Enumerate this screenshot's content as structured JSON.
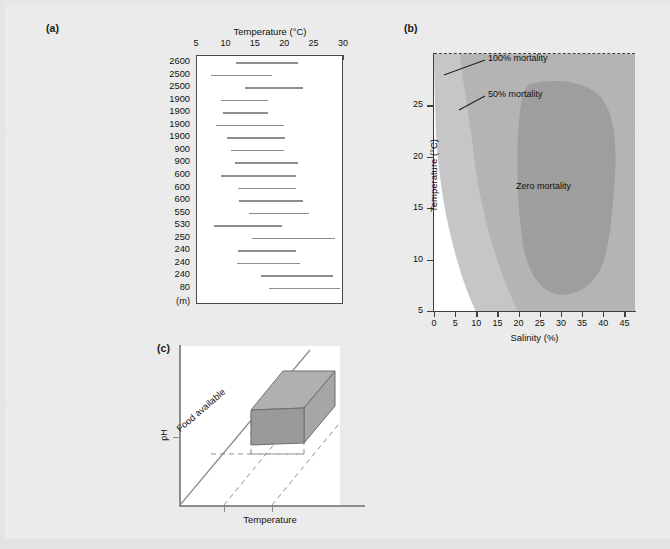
{
  "figure": {
    "background_color": "#ebebeb",
    "bar_color": "#8d8d8d",
    "axis_color": "#3f3f3f"
  },
  "panel_a": {
    "label": "(a)",
    "axis_title": "Temperature (°C)",
    "unit_label": "(m)",
    "ticks": [
      5,
      10,
      15,
      20,
      25,
      30
    ],
    "tick_labels": [
      "5",
      "10",
      "15",
      "20",
      "25",
      "30"
    ],
    "xlim": [
      5,
      30
    ],
    "altitude_unit": "m",
    "rows": [
      {
        "species": "Ranunculus glacialis",
        "altitude": "2600",
        "low": 11.6,
        "high": 22.2
      },
      {
        "species": "Oxyria digyna",
        "altitude": "2500",
        "low": 7.3,
        "high": 17.8
      },
      {
        "species": "Geum reptans",
        "altitude": "2500",
        "low": 13.2,
        "high": 23.1
      },
      {
        "species": "Pinus cembra",
        "altitude": "1900",
        "low": 9.0,
        "high": 17.1
      },
      {
        "species": "Picea abies",
        "altitude": "1900",
        "low": 9.4,
        "high": 17.1
      },
      {
        "species": "Betula pendula",
        "altitude": "1900",
        "low": 8.2,
        "high": 19.8
      },
      {
        "species": "Larix decidua",
        "altitude": "1900",
        "low": 10.1,
        "high": 19.9
      },
      {
        "species": "Picea abies",
        "altitude": "900",
        "low": 10.7,
        "high": 19.8
      },
      {
        "species": "Larix decidua",
        "altitude": "900",
        "low": 11.5,
        "high": 22.1
      },
      {
        "species": "Leucojum vernum",
        "altitude": "600",
        "low": 9.0,
        "high": 21.9
      },
      {
        "species": "Betula pendula",
        "altitude": "600",
        "low": 11.9,
        "high": 21.9
      },
      {
        "species": "Fagus sylvatica",
        "altitude": "600",
        "low": 12.1,
        "high": 23.0
      },
      {
        "species": "Taxus baccata",
        "altitude": "550",
        "low": 13.9,
        "high": 24.1
      },
      {
        "species": "Abies alba",
        "altitude": "530",
        "low": 7.9,
        "high": 19.4
      },
      {
        "species": "Prunus laurocerasus",
        "altitude": "250",
        "low": 14.3,
        "high": 28.4
      },
      {
        "species": "Quercus ilex",
        "altitude": "240",
        "low": 11.9,
        "high": 21.8
      },
      {
        "species": "Olea europaea",
        "altitude": "240",
        "low": 11.8,
        "high": 22.6
      },
      {
        "species": "Quercus pubescens",
        "altitude": "240",
        "low": 15.8,
        "high": 28.2
      },
      {
        "species": "Citrus limonum",
        "altitude": "80",
        "low": 17.2,
        "high": 29.4
      }
    ]
  },
  "panel_b": {
    "label": "(b)",
    "x_title": "Salinity (%)",
    "y_title": "Temperature (°C)",
    "x_ticks": [
      0,
      5,
      10,
      15,
      20,
      25,
      30,
      35,
      40,
      45
    ],
    "x_tick_labels": [
      "0",
      "5",
      "10",
      "15",
      "20",
      "25",
      "30",
      "35",
      "40",
      "45"
    ],
    "y_ticks": [
      5,
      10,
      15,
      20,
      25
    ],
    "y_tick_labels": [
      "5",
      "10",
      "15",
      "20",
      "25"
    ],
    "xlim": [
      0,
      47.5
    ],
    "ylim": [
      5,
      30
    ],
    "zones": [
      {
        "name": "100% mortality",
        "fill": "#c6c6c6"
      },
      {
        "name": "50% mortality",
        "fill": "#b4b4b4"
      },
      {
        "name": "Zero mortality",
        "fill": "#9e9e9e"
      }
    ],
    "annotations": [
      {
        "text": "100% mortality"
      },
      {
        "text": "50% mortality"
      },
      {
        "text": "Zero mortality"
      }
    ]
  },
  "panel_c": {
    "label": "(c)",
    "y_axis_label": "pH",
    "x_axis_label": "Temperature",
    "z_axis_label": "Food available",
    "box_front_color": "#9a9a9a",
    "box_top_color": "#b0b0b0",
    "box_side_color": "#a6a6a6"
  },
  "chart_data": [
    {
      "type": "bar",
      "panel": "(a)",
      "title": "Temperature (°C)",
      "xlabel": "Temperature (°C)",
      "ylabel": "Species (altitude, m)",
      "xlim": [
        5,
        30
      ],
      "grid": false,
      "orientation": "horizontal-range",
      "categories": [
        "Ranunculus glacialis 2600",
        "Oxyria digyna 2500",
        "Geum reptans 2500",
        "Pinus cembra 1900",
        "Picea abies 1900",
        "Betula pendula 1900",
        "Larix decidua 1900",
        "Picea abies 900",
        "Larix decidua 900",
        "Leucojum vernum 600",
        "Betula pendula 600",
        "Fagus sylvatica 600",
        "Taxus baccata 550",
        "Abies alba 530",
        "Prunus laurocerasus 250",
        "Quercus ilex 240",
        "Olea europaea 240",
        "Quercus pubescens 240",
        "Citrus limonum 80"
      ],
      "ranges": [
        [
          11.6,
          22.2
        ],
        [
          7.3,
          17.8
        ],
        [
          13.2,
          23.1
        ],
        [
          9.0,
          17.1
        ],
        [
          9.4,
          17.1
        ],
        [
          8.2,
          19.8
        ],
        [
          10.1,
          19.9
        ],
        [
          10.7,
          19.8
        ],
        [
          11.5,
          22.1
        ],
        [
          9.0,
          21.9
        ],
        [
          11.9,
          21.9
        ],
        [
          12.1,
          23.0
        ],
        [
          13.9,
          24.1
        ],
        [
          7.9,
          19.4
        ],
        [
          14.3,
          28.4
        ],
        [
          11.9,
          21.8
        ],
        [
          11.8,
          22.6
        ],
        [
          15.8,
          28.2
        ],
        [
          17.2,
          29.4
        ]
      ]
    },
    {
      "type": "heatmap",
      "panel": "(b)",
      "title": "Mortality contours",
      "xlabel": "Salinity (%)",
      "ylabel": "Temperature (°C)",
      "xlim": [
        0,
        47.5
      ],
      "ylim": [
        5,
        30
      ],
      "grid": false,
      "legend_position": "inline-annotations",
      "contours": [
        {
          "label": "100% mortality",
          "level": 100,
          "fill": "#c6c6c6"
        },
        {
          "label": "50% mortality",
          "level": 50,
          "fill": "#b4b4b4"
        },
        {
          "label": "Zero mortality",
          "level": 0,
          "fill": "#9e9e9e"
        }
      ]
    },
    {
      "type": "scatter",
      "panel": "(c)",
      "title": "Three-dimensional niche",
      "xlabel": "Temperature",
      "ylabel": "pH",
      "zlabel": "Food available",
      "grid": false,
      "annotations": [
        "Food available"
      ]
    }
  ]
}
